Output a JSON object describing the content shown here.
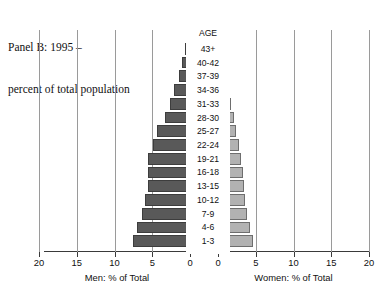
{
  "title": {
    "line1": "Panel B: 1995 –",
    "line2": "percent of total population"
  },
  "age_header": "AGE",
  "axis": {
    "men_caption": "Men: % of Total",
    "women_caption": "Women: % of Total",
    "men_ticks": [
      "20",
      "15",
      "10",
      "5",
      "0"
    ],
    "women_ticks": [
      "0",
      "5",
      "10",
      "15",
      "20"
    ]
  },
  "colors": {
    "men_bar": "#595959",
    "women_bar": "#b2b2b2",
    "gridline": "#9a9a9a",
    "axis": "#3a3a3a",
    "background": "#ffffff",
    "text": "#111111"
  },
  "chart_data": {
    "type": "bar",
    "subtype": "population-pyramid",
    "title": "Panel B: 1995 – percent of total population",
    "xlabel_left": "Men: % of Total",
    "xlabel_right": "Women: % of Total",
    "ylabel": "AGE",
    "xlim": [
      0,
      20
    ],
    "grid": true,
    "legend": "none",
    "orientation": "horizontal",
    "categories": [
      "43+",
      "40-42",
      "37-39",
      "34-36",
      "31-33",
      "28-30",
      "25-27",
      "22-24",
      "19-21",
      "16-18",
      "13-15",
      "10-12",
      "7-9",
      "4-6",
      "1-3"
    ],
    "series": [
      {
        "name": "Men: % of Total",
        "direction": "left",
        "color": "#595959",
        "values": [
          0.6,
          1.0,
          1.5,
          2.1,
          2.6,
          3.3,
          4.4,
          4.9,
          5.6,
          5.6,
          5.6,
          6.0,
          6.4,
          7.0,
          7.5
        ]
      },
      {
        "name": "Women: % of Total",
        "direction": "right",
        "color": "#b2b2b2",
        "values": [
          0.3,
          0.5,
          0.8,
          1.3,
          1.7,
          2.1,
          2.4,
          2.8,
          3.1,
          3.3,
          3.4,
          3.6,
          3.9,
          4.3,
          4.6
        ]
      }
    ]
  }
}
